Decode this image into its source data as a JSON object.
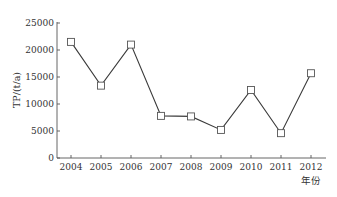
{
  "chart_data": {
    "type": "line",
    "title": "",
    "xlabel": "年份",
    "ylabel": "TP/(t/a)",
    "categories": [
      "2004",
      "2005",
      "2006",
      "2007",
      "2008",
      "2009",
      "2010",
      "2011",
      "2012"
    ],
    "series": [
      {
        "name": "TP",
        "marker": "open-square",
        "values": [
          21500,
          13400,
          21000,
          7800,
          7700,
          5200,
          12600,
          4600,
          15700
        ]
      }
    ],
    "ylim": [
      0,
      25000
    ],
    "yticks": [
      0,
      5000,
      10000,
      15000,
      20000,
      25000
    ],
    "ytick_labels": [
      "0",
      "5000",
      "10000",
      "15000",
      "20000",
      "25000"
    ],
    "grid": false,
    "legend": null
  },
  "colors": {
    "line": "#3a3a3a",
    "marker_fill": "#ffffff",
    "axis": "#555555",
    "text": "#333333"
  }
}
